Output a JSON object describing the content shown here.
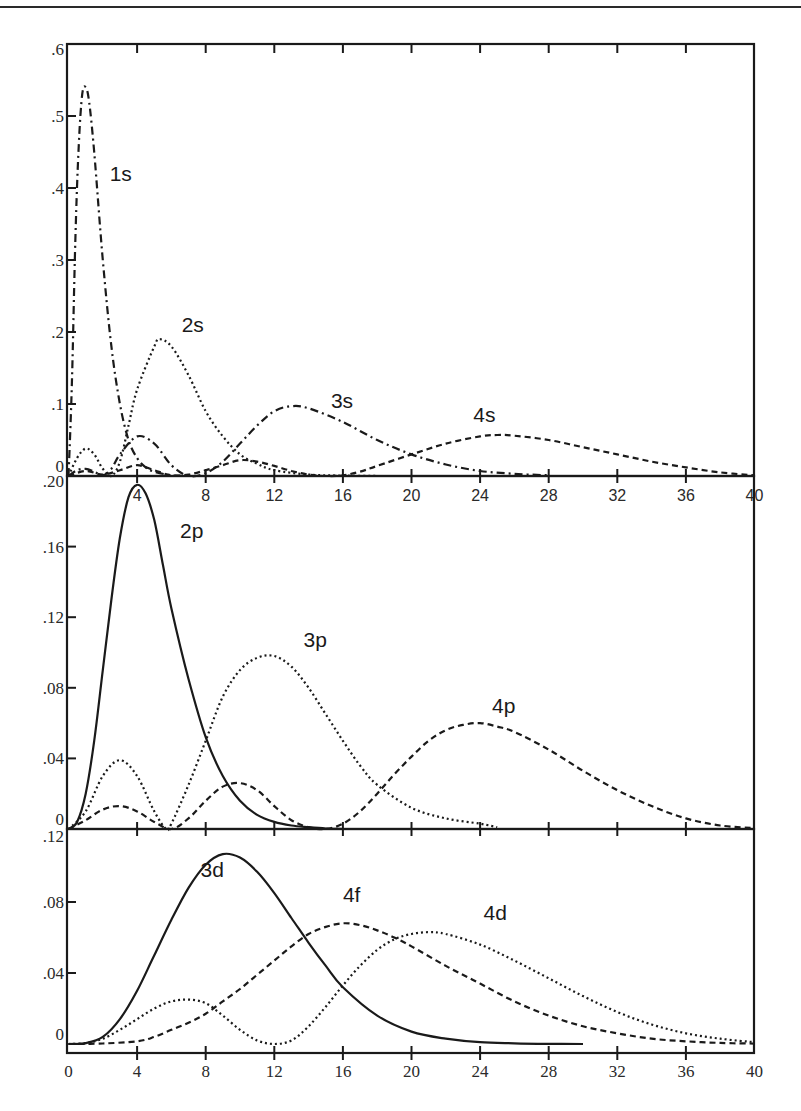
{
  "chart_data": [
    {
      "type": "line",
      "panel": "top",
      "title": "",
      "xlabel": "",
      "ylabel": "",
      "xlim": [
        0,
        40
      ],
      "ylim": [
        0,
        0.6
      ],
      "x_ticks": [
        4,
        8,
        12,
        16,
        20,
        24,
        28,
        32,
        36,
        40
      ],
      "x_tick_labels": [
        "4",
        "8",
        "12",
        "16",
        "20",
        "24",
        "28",
        "32",
        "36",
        "40"
      ],
      "y_ticks": [
        0,
        0.1,
        0.2,
        0.3,
        0.4,
        0.5,
        0.6
      ],
      "y_tick_labels": [
        "0",
        ".1",
        ".2",
        ".3",
        ".4",
        ".5",
        ".6"
      ],
      "grid": false,
      "legend": "inline labels",
      "series": [
        {
          "name": "1s",
          "style": "dashdot",
          "x": [
            0,
            0.2,
            0.4,
            0.6,
            0.8,
            1.0,
            1.2,
            1.5,
            2,
            2.5,
            3,
            3.5,
            4,
            4.5,
            5,
            6,
            7
          ],
          "y": [
            0,
            0.13,
            0.33,
            0.46,
            0.53,
            0.54,
            0.52,
            0.45,
            0.3,
            0.18,
            0.1,
            0.05,
            0.025,
            0.012,
            0.006,
            0.001,
            0
          ]
        },
        {
          "name": "2s",
          "style": "dotted",
          "x": [
            0,
            0.5,
            1,
            1.5,
            2,
            2.5,
            3,
            3.5,
            4,
            5,
            5.3,
            6,
            7,
            8,
            9,
            10,
            11,
            12,
            14,
            16,
            18
          ],
          "y": [
            0,
            0.025,
            0.038,
            0.03,
            0.01,
            0,
            0.02,
            0.07,
            0.12,
            0.18,
            0.19,
            0.18,
            0.14,
            0.09,
            0.055,
            0.03,
            0.017,
            0.008,
            0.002,
            0.0005,
            0
          ]
        },
        {
          "name": "3s",
          "style": "dashdot",
          "x": [
            0,
            0.5,
            1,
            1.5,
            2,
            2.5,
            3,
            4,
            5,
            6,
            7,
            8,
            9,
            10,
            11,
            12,
            13,
            14,
            16,
            18,
            20,
            22,
            24,
            26,
            28
          ],
          "y": [
            0,
            0.008,
            0.01,
            0.006,
            0.001,
            0.01,
            0.03,
            0.055,
            0.045,
            0.015,
            0,
            0.004,
            0.02,
            0.045,
            0.07,
            0.09,
            0.097,
            0.094,
            0.075,
            0.05,
            0.03,
            0.016,
            0.007,
            0.003,
            0.001
          ]
        },
        {
          "name": "4s",
          "style": "dashed",
          "x": [
            0,
            1,
            2,
            3,
            4,
            5,
            6,
            7,
            8,
            9,
            10,
            11,
            12,
            13,
            14,
            15,
            16,
            17,
            18,
            20,
            22,
            24,
            25,
            26,
            28,
            30,
            32,
            34,
            36,
            38,
            40
          ],
          "y": [
            0,
            0.007,
            0.002,
            0.008,
            0.015,
            0.008,
            0.001,
            0.002,
            0.008,
            0.015,
            0.022,
            0.02,
            0.014,
            0.007,
            0.002,
            0,
            0.001,
            0.006,
            0.014,
            0.03,
            0.045,
            0.055,
            0.057,
            0.056,
            0.05,
            0.04,
            0.03,
            0.02,
            0.012,
            0.005,
            0.001
          ]
        }
      ],
      "annotations": [
        {
          "text": "1s",
          "x": 2.4,
          "y": 0.41
        },
        {
          "text": "2s",
          "x": 6.6,
          "y": 0.2
        },
        {
          "text": "3s",
          "x": 15.3,
          "y": 0.095
        },
        {
          "text": "4s",
          "x": 23.6,
          "y": 0.075
        }
      ]
    },
    {
      "type": "line",
      "panel": "middle",
      "title": "",
      "xlabel": "",
      "ylabel": "",
      "xlim": [
        0,
        40
      ],
      "ylim": [
        0,
        0.2
      ],
      "x_ticks": [
        4,
        8,
        12,
        16,
        20,
        24,
        28,
        32,
        36,
        40
      ],
      "y_ticks": [
        0,
        0.04,
        0.08,
        0.12,
        0.16,
        0.2
      ],
      "y_tick_labels": [
        "0",
        ".04",
        ".08",
        ".12",
        ".16",
        ".20"
      ],
      "grid": false,
      "legend": "inline labels",
      "series": [
        {
          "name": "2p",
          "style": "solid",
          "x": [
            0,
            0.5,
            1,
            1.5,
            2,
            2.5,
            3,
            3.5,
            4,
            4.5,
            5,
            5.5,
            6,
            7,
            8,
            9,
            10,
            11,
            12,
            13,
            14,
            15,
            16
          ],
          "y": [
            0,
            0.004,
            0.02,
            0.05,
            0.09,
            0.13,
            0.165,
            0.188,
            0.195,
            0.19,
            0.175,
            0.15,
            0.125,
            0.085,
            0.052,
            0.03,
            0.016,
            0.008,
            0.004,
            0.002,
            0.001,
            0.0003,
            0
          ]
        },
        {
          "name": "3p",
          "style": "dotted",
          "x": [
            0,
            1,
            2,
            3,
            4,
            5,
            5.7,
            6,
            7,
            8,
            9,
            10,
            11,
            12,
            13,
            14,
            15,
            16,
            17,
            18,
            20,
            22,
            24,
            25
          ],
          "y": [
            0,
            0.01,
            0.03,
            0.039,
            0.03,
            0.01,
            0,
            0.003,
            0.025,
            0.05,
            0.075,
            0.09,
            0.097,
            0.098,
            0.092,
            0.08,
            0.065,
            0.05,
            0.036,
            0.025,
            0.012,
            0.006,
            0.003,
            0.001
          ]
        },
        {
          "name": "4p",
          "style": "dashed",
          "x": [
            0,
            1,
            2,
            3,
            4,
            5,
            6,
            7,
            8,
            9,
            10,
            11,
            12,
            13,
            14,
            15,
            16,
            17,
            18,
            19,
            20,
            21,
            22,
            23,
            24,
            25,
            26,
            28,
            30,
            32,
            34,
            36,
            38,
            40
          ],
          "y": [
            0,
            0.005,
            0.011,
            0.013,
            0.01,
            0.004,
            0,
            0.006,
            0.016,
            0.024,
            0.026,
            0.022,
            0.013,
            0.005,
            0.001,
            0,
            0.003,
            0.01,
            0.02,
            0.031,
            0.041,
            0.05,
            0.056,
            0.059,
            0.06,
            0.058,
            0.055,
            0.045,
            0.033,
            0.022,
            0.013,
            0.006,
            0.002,
            0.0005
          ]
        }
      ],
      "annotations": [
        {
          "text": "2p",
          "x": 6.5,
          "y": 0.165
        },
        {
          "text": "3p",
          "x": 13.7,
          "y": 0.103
        },
        {
          "text": "4p",
          "x": 24.7,
          "y": 0.066
        }
      ]
    },
    {
      "type": "line",
      "panel": "bottom",
      "title": "",
      "xlabel": "",
      "ylabel": "",
      "xlim": [
        0,
        40
      ],
      "ylim": [
        0,
        0.12
      ],
      "x_ticks": [
        0,
        4,
        8,
        12,
        16,
        20,
        24,
        28,
        32,
        36,
        40
      ],
      "x_tick_labels": [
        "0",
        "4",
        "8",
        "12",
        "16",
        "20",
        "24",
        "28",
        "32",
        "36",
        "40"
      ],
      "y_ticks": [
        0,
        0.04,
        0.08,
        0.12
      ],
      "y_tick_labels": [
        "0",
        ".04",
        ".08",
        ".12"
      ],
      "grid": false,
      "legend": "inline labels",
      "series": [
        {
          "name": "3d",
          "style": "solid",
          "x": [
            0,
            1,
            2,
            3,
            4,
            5,
            6,
            7,
            8,
            9,
            10,
            11,
            12,
            13,
            14,
            15,
            16,
            18,
            20,
            22,
            24,
            26,
            28,
            30
          ],
          "y": [
            0,
            0.0005,
            0.004,
            0.014,
            0.03,
            0.05,
            0.07,
            0.088,
            0.101,
            0.107,
            0.105,
            0.097,
            0.085,
            0.071,
            0.057,
            0.044,
            0.032,
            0.016,
            0.007,
            0.003,
            0.001,
            0.0004,
            0.0001,
            0
          ]
        },
        {
          "name": "4d",
          "style": "dotted",
          "x": [
            0,
            1,
            2,
            3,
            4,
            5,
            6,
            7,
            8,
            9,
            10,
            11,
            12,
            13,
            14,
            15,
            16,
            17,
            18,
            19,
            20,
            21,
            22,
            24,
            26,
            28,
            30,
            32,
            34,
            36,
            38,
            40
          ],
          "y": [
            0,
            0.0005,
            0.003,
            0.008,
            0.014,
            0.02,
            0.024,
            0.025,
            0.023,
            0.016,
            0.008,
            0.002,
            0,
            0.002,
            0.01,
            0.021,
            0.033,
            0.044,
            0.053,
            0.059,
            0.062,
            0.063,
            0.062,
            0.056,
            0.047,
            0.037,
            0.027,
            0.018,
            0.011,
            0.006,
            0.003,
            0.001
          ]
        },
        {
          "name": "4f",
          "style": "dashed",
          "x": [
            0,
            2,
            4,
            5,
            6,
            7,
            8,
            9,
            10,
            11,
            12,
            13,
            14,
            15,
            16,
            17,
            18,
            19,
            20,
            22,
            24,
            26,
            28,
            30,
            32,
            34,
            36,
            38,
            40
          ],
          "y": [
            0,
            0.0003,
            0.0015,
            0.004,
            0.008,
            0.012,
            0.017,
            0.024,
            0.031,
            0.039,
            0.047,
            0.055,
            0.062,
            0.066,
            0.068,
            0.067,
            0.064,
            0.06,
            0.055,
            0.044,
            0.034,
            0.024,
            0.016,
            0.01,
            0.006,
            0.003,
            0.0015,
            0.0006,
            0.0002
          ]
        }
      ],
      "annotations": [
        {
          "text": "3d",
          "x": 7.7,
          "y": 0.094
        },
        {
          "text": "4f",
          "x": 16.0,
          "y": 0.08
        },
        {
          "text": "4d",
          "x": 24.2,
          "y": 0.07
        }
      ]
    }
  ],
  "panels": [
    {
      "name": "s-orbitals",
      "top": 44,
      "bottom": 476,
      "ymax": 0.6
    },
    {
      "name": "p-orbitals",
      "top": 476,
      "bottom": 829,
      "ymax": 0.2
    },
    {
      "name": "d-f-orbitals",
      "top": 831,
      "bottom": 1044,
      "ymax": 0.12,
      "axis_y": 1053
    }
  ],
  "colors": {
    "ink": "#1a1a1a",
    "background": "#ffffff"
  }
}
